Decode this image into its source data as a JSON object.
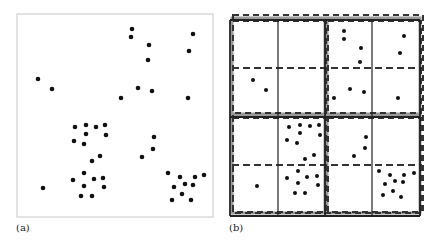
{
  "figure": {
    "panels": [
      {
        "id": "a",
        "label": "(a)",
        "frame": {
          "x": 17,
          "y": 14,
          "w": 196,
          "h": 203,
          "stroke": "#c8c8c8"
        },
        "points": [
          [
            132,
            29
          ],
          [
            131,
            37
          ],
          [
            149,
            45
          ],
          [
            148,
            60
          ],
          [
            193,
            34
          ],
          [
            189,
            51
          ],
          [
            38,
            79
          ],
          [
            52,
            89
          ],
          [
            138,
            88
          ],
          [
            152,
            91
          ],
          [
            121,
            98
          ],
          [
            188,
            98
          ],
          [
            75,
            127
          ],
          [
            86,
            125
          ],
          [
            96,
            127
          ],
          [
            105,
            125
          ],
          [
            86,
            134
          ],
          [
            106,
            135
          ],
          [
            74,
            141
          ],
          [
            84,
            144
          ],
          [
            154,
            137
          ],
          [
            153,
            149
          ],
          [
            142,
            157
          ],
          [
            100,
            156
          ],
          [
            92,
            161
          ],
          [
            84,
            173
          ],
          [
            73,
            180
          ],
          [
            94,
            179
          ],
          [
            103,
            178
          ],
          [
            84,
            186
          ],
          [
            104,
            187
          ],
          [
            81,
            196
          ],
          [
            92,
            196
          ],
          [
            43,
            188
          ],
          [
            168,
            173
          ],
          [
            180,
            177
          ],
          [
            195,
            177
          ],
          [
            204,
            175
          ],
          [
            174,
            187
          ],
          [
            185,
            184
          ],
          [
            193,
            185
          ],
          [
            182,
            194
          ],
          [
            172,
            200
          ],
          [
            191,
            200
          ]
        ],
        "point_color": "#111111"
      },
      {
        "id": "b",
        "label": "(b)",
        "grid": {
          "x": [
            230,
            278,
            325,
            372,
            420
          ],
          "y": [
            20,
            117,
            216
          ],
          "mid_y": [
            68,
            165
          ],
          "solid_color": "#222222",
          "dash_color": "#333333",
          "shadow_color": "#9a9a9a"
        },
        "points": [
          [
            344,
            31
          ],
          [
            344,
            39
          ],
          [
            361,
            48
          ],
          [
            360,
            62
          ],
          [
            404,
            36
          ],
          [
            400,
            53
          ],
          [
            253,
            80
          ],
          [
            266,
            90
          ],
          [
            334,
            98
          ],
          [
            350,
            89
          ],
          [
            364,
            92
          ],
          [
            398,
            98
          ],
          [
            289,
            127
          ],
          [
            300,
            125
          ],
          [
            310,
            126
          ],
          [
            319,
            125
          ],
          [
            300,
            133
          ],
          [
            320,
            135
          ],
          [
            287,
            140
          ],
          [
            297,
            143
          ],
          [
            366,
            137
          ],
          [
            365,
            148
          ],
          [
            354,
            156
          ],
          [
            314,
            155
          ],
          [
            305,
            159
          ],
          [
            298,
            171
          ],
          [
            287,
            178
          ],
          [
            307,
            177
          ],
          [
            317,
            176
          ],
          [
            298,
            183
          ],
          [
            318,
            185
          ],
          [
            295,
            193
          ],
          [
            305,
            193
          ],
          [
            257,
            186
          ],
          [
            379,
            171
          ],
          [
            390,
            175
          ],
          [
            404,
            175
          ],
          [
            414,
            173
          ],
          [
            385,
            184
          ],
          [
            395,
            181
          ],
          [
            403,
            182
          ],
          [
            393,
            191
          ],
          [
            383,
            195
          ],
          [
            401,
            197
          ]
        ],
        "point_color": "#111111"
      }
    ]
  }
}
